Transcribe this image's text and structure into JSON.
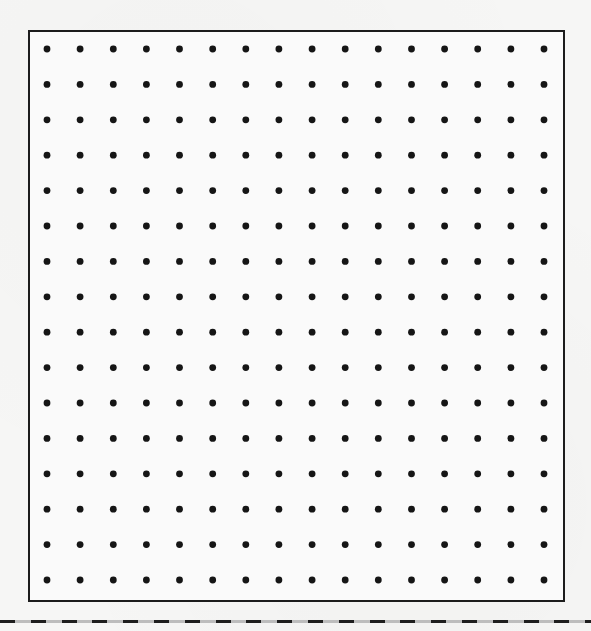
{
  "page": {
    "type": "dot-grid-worksheet",
    "background_color": "#f6f6f5",
    "ink_color": "#151515"
  },
  "dot_grid": {
    "columns": 16,
    "rows": 16,
    "dot_color": "#151515",
    "frame_color": "#1c1c1c"
  },
  "cut_line": {
    "style": "dashed",
    "dash_color": "#1e1e1e",
    "gap_color": "#bdbdbd"
  }
}
